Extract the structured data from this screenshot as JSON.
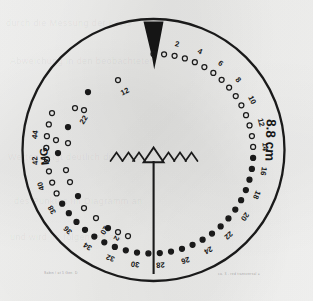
{
  "figure": {
    "background_color": "#f2f2f1",
    "ink_color": "#1a1a1a",
    "circle": {
      "cx": 153.5,
      "cy": 150,
      "r": 131,
      "stroke_width": 2.2
    },
    "wedge": {
      "name": "north-pointer-wedge",
      "description": "solid black tapered wedge from circle top edge to the 0 point"
    },
    "radial_line": {
      "name": "vertical-radius-line",
      "description": "vertical line from centre triangle down to lower circle edge"
    },
    "center_marker": {
      "main_symbol": "triangle-outline",
      "side_symbol": "chevron",
      "left_chevrons": 3,
      "right_chevrons": 3
    },
    "scale_label_right": "8.8 cm",
    "scale_label_left": "MG",
    "caption_left": "Sabin / at 5 Gen.  D",
    "caption_right": "ca. 3 - red transversal  =",
    "ghost_lines": [
      "durch die  Messung der Kreis",
      "Abweichung  in  den  beobachteten",
      "Werten  zeigt  deutlich  die  Lage",
      "des  Punktes  im  Diagramm  an",
      "und  wird  im  folgenden  als"
    ]
  },
  "chart_data": {
    "type": "scatter",
    "coordinate_system": "polar-spiral",
    "xlabel": "",
    "ylabel": "",
    "annotations": [
      "8.8 cm",
      "MG"
    ],
    "grid": false,
    "legend": null,
    "outer_spiral": {
      "name": "numbered-point-spiral",
      "description": "open circles spiralling clockwise from 0 at top, every second point labelled with an even number",
      "marker": "open-circle",
      "start_angle_deg": -90,
      "sweep_deg": 290,
      "point_count": 47,
      "labelled_every": 2,
      "labels": [
        0,
        2,
        4,
        6,
        8,
        10,
        12,
        14,
        16,
        18,
        20,
        22,
        24,
        26,
        28,
        30,
        32,
        34,
        36,
        38,
        40,
        42,
        44
      ],
      "radius_start_px": 96,
      "radius_end_px": 108
    },
    "inner_points": {
      "name": "inner-scatter-points",
      "description": "sparse open circles on the left interior, loosely mirroring the spiral, with stray labels",
      "marker": "open-circle",
      "labels": [
        "12",
        "22",
        "2",
        "10"
      ],
      "point_count": 16
    }
  }
}
